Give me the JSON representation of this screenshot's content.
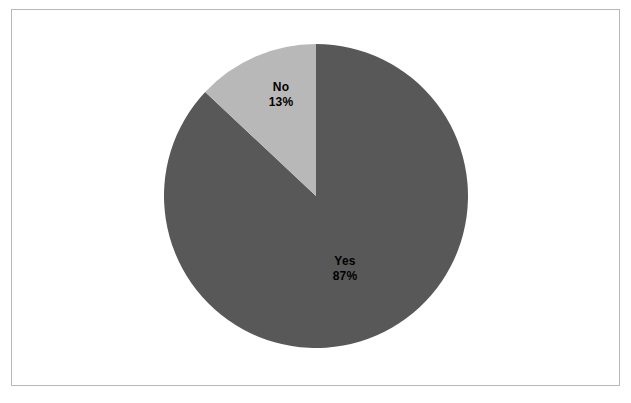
{
  "figure": {
    "background_color": "#ffffff",
    "border_color": "#b9b9b9"
  },
  "chart_data": {
    "type": "pie",
    "title": "",
    "subtitle": "",
    "xlabel": "",
    "ylabel": "",
    "legend_position": "none",
    "grid": false,
    "labels_inside": true,
    "start_angle_deg": 90,
    "direction": "clockwise",
    "categories": [
      "Yes",
      "No"
    ],
    "values": [
      87,
      13
    ],
    "units": "percent",
    "slices": [
      {
        "label": "Yes",
        "value": 87,
        "value_text": "87%",
        "color": "#585858",
        "angle_deg": 313.2
      },
      {
        "label": "No",
        "value": 13,
        "value_text": "13%",
        "color": "#b8b8b8",
        "angle_deg": 46.8
      }
    ],
    "annotations": [
      {
        "text": "No",
        "value_text": "13%"
      },
      {
        "text": "Yes",
        "value_text": "87%"
      }
    ]
  },
  "labels": {
    "no": {
      "name": "No",
      "value": "13%"
    },
    "yes": {
      "name": "Yes",
      "value": "87%"
    }
  }
}
